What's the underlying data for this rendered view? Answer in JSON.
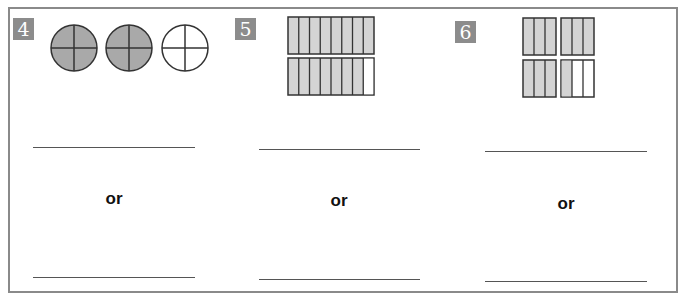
{
  "problems": [
    {
      "number": "4",
      "model": "circles",
      "parts_per_whole": 4,
      "wholes": [
        {
          "shaded": 4,
          "parts": 4
        },
        {
          "shaded": 4,
          "parts": 4
        },
        {
          "shaded": 0,
          "parts": 4
        }
      ],
      "connector": "or"
    },
    {
      "number": "5",
      "model": "rectangles",
      "parts_per_whole": 8,
      "wholes": [
        {
          "shaded": 8,
          "parts": 8
        },
        {
          "shaded": 7,
          "parts": 8
        }
      ],
      "connector": "or"
    },
    {
      "number": "6",
      "model": "rectangles",
      "parts_per_whole": 3,
      "wholes": [
        {
          "shaded": 3,
          "parts": 3
        },
        {
          "shaded": 3,
          "parts": 3
        },
        {
          "shaded": 3,
          "parts": 3
        },
        {
          "shaded": 1,
          "parts": 3
        }
      ],
      "connector": "or"
    }
  ],
  "colors": {
    "shaded_circle": "#a9a9a9",
    "shaded_rect": "#d4d4d4",
    "badge": "#8c8c8c",
    "border": "#8a8a8a"
  }
}
